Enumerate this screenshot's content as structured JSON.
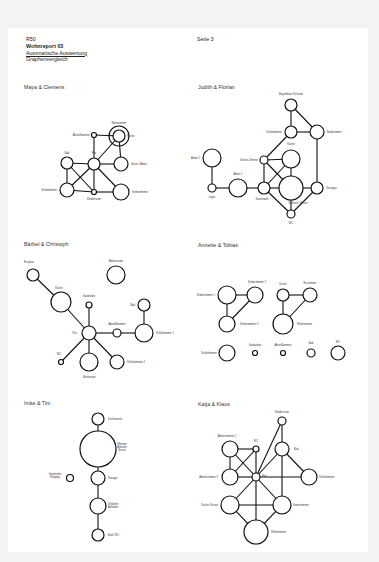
{
  "header": {
    "code": "R50",
    "title": "Wohnreport 03",
    "subtitle": "Automatische Auswertung",
    "section": "Graphenvergleich",
    "page": "Seite 3"
  },
  "colors": {
    "page": "#ffffff",
    "background": "#f3f3f3",
    "stroke": "#111111",
    "text": "#333333"
  },
  "graphs": [
    {
      "title": "Maya & Clemens",
      "tx": 24,
      "ty": 115,
      "nodes": [
        {
          "id": "wz",
          "label": "Wohnzimmer",
          "x": 119,
          "y": 136,
          "r": 10,
          "lx": 119,
          "ly": 124,
          "anchor": "middle"
        },
        {
          "id": "ku",
          "label": "Küche",
          "x": 119,
          "y": 136,
          "r": 6,
          "lx": 127,
          "ly": 137,
          "anchor": "start"
        },
        {
          "id": "ab",
          "label": "Abstellkammer",
          "x": 94,
          "y": 135,
          "r": 2.5,
          "lx": 90,
          "ly": 136,
          "anchor": "end"
        },
        {
          "id": "fl",
          "label": "Flur",
          "x": 94,
          "y": 164,
          "r": 6,
          "lx": 94,
          "ly": 154,
          "anchor": "middle"
        },
        {
          "id": "bad",
          "label": "Bad",
          "x": 67,
          "y": 163,
          "r": 6,
          "lx": 67,
          "ly": 154,
          "anchor": "middle"
        },
        {
          "id": "ga",
          "label": "Gäste / Arbeit",
          "x": 121,
          "y": 164,
          "r": 7,
          "lx": 131,
          "ly": 165,
          "anchor": "start"
        },
        {
          "id": "sz",
          "label": "Schlafzimmer",
          "x": 67,
          "y": 190,
          "r": 7,
          "lx": 57,
          "ly": 191,
          "anchor": "end"
        },
        {
          "id": "kl",
          "label": "Kleiderraum",
          "x": 94,
          "y": 192,
          "r": 2.5,
          "lx": 94,
          "ly": 200,
          "anchor": "middle"
        },
        {
          "id": "kz",
          "label": "Kinderzimmer",
          "x": 121,
          "y": 192,
          "r": 8,
          "lx": 132,
          "ly": 193,
          "anchor": "start"
        }
      ],
      "edges": [
        [
          "ab",
          "ku"
        ],
        [
          "ab",
          "fl"
        ],
        [
          "fl",
          "ku"
        ],
        [
          "fl",
          "bad"
        ],
        [
          "fl",
          "ga"
        ],
        [
          "ga",
          "ku"
        ],
        [
          "bad",
          "sz"
        ],
        [
          "bad",
          "kl"
        ],
        [
          "fl",
          "sz"
        ],
        [
          "fl",
          "kl"
        ],
        [
          "fl",
          "kz"
        ],
        [
          "sz",
          "kl"
        ],
        [
          "kl",
          "kz"
        ]
      ]
    },
    {
      "title": "Judith & Florian",
      "tx": 198,
      "ty": 118,
      "nodes": [
        {
          "id": "bs",
          "label": "Begehbarer Schrank",
          "x": 291,
          "y": 105,
          "r": 6,
          "lx": 291,
          "ly": 95,
          "anchor": "middle"
        },
        {
          "id": "sz",
          "label": "Schlafzimmer",
          "x": 291,
          "y": 132,
          "r": 6,
          "lx": 282,
          "ly": 133,
          "anchor": "end"
        },
        {
          "id": "bz",
          "label": "Badezimmer",
          "x": 317,
          "y": 132,
          "r": 7,
          "lx": 327,
          "ly": 133,
          "anchor": "start"
        },
        {
          "id": "ku",
          "label": "Küche",
          "x": 291,
          "y": 159,
          "r": 9,
          "lx": 291,
          "ly": 145,
          "anchor": "middle"
        },
        {
          "id": "gz",
          "label": "Grünes Zimmer",
          "x": 264,
          "y": 160,
          "r": 4,
          "lx": 258,
          "ly": 161,
          "anchor": "end"
        },
        {
          "id": "a2",
          "label": "Arbeit 2",
          "x": 212,
          "y": 158,
          "r": 9,
          "lx": 200,
          "ly": 159,
          "anchor": "end"
        },
        {
          "id": "a1",
          "label": "Arbeit 1",
          "x": 238,
          "y": 188,
          "r": 9,
          "lx": 238,
          "ly": 175,
          "anchor": "middle"
        },
        {
          "id": "lg",
          "label": "Lager",
          "x": 212,
          "y": 188,
          "r": 4,
          "lx": 212,
          "ly": 198,
          "anchor": "middle"
        },
        {
          "id": "kw",
          "label": "Katzenwelt",
          "x": 264,
          "y": 188,
          "r": 6,
          "lx": 262,
          "ly": 200,
          "anchor": "middle"
        },
        {
          "id": "we",
          "label": "Wohnen / Essen",
          "x": 291,
          "y": 188,
          "r": 12,
          "lx": 298,
          "ly": 204,
          "anchor": "middle"
        },
        {
          "id": "tn",
          "label": "Teenager",
          "x": 317,
          "y": 188,
          "r": 6,
          "lx": 326,
          "ly": 189,
          "anchor": "start"
        },
        {
          "id": "wc",
          "label": "WC",
          "x": 291,
          "y": 214,
          "r": 4,
          "lx": 291,
          "ly": 224,
          "anchor": "middle"
        }
      ],
      "edges": [
        [
          "bs",
          "sz"
        ],
        [
          "bs",
          "bz"
        ],
        [
          "sz",
          "bz"
        ],
        [
          "sz",
          "gz"
        ],
        [
          "bz",
          "tn"
        ],
        [
          "gz",
          "ku"
        ],
        [
          "gz",
          "kw"
        ],
        [
          "gz",
          "we"
        ],
        [
          "ku",
          "kw"
        ],
        [
          "ku",
          "we"
        ],
        [
          "a2",
          "lg"
        ],
        [
          "lg",
          "a1"
        ],
        [
          "a1",
          "kw"
        ],
        [
          "kw",
          "we"
        ],
        [
          "kw",
          "wc"
        ],
        [
          "we",
          "wc"
        ],
        [
          "we",
          "tn"
        ],
        [
          "tn",
          "wc"
        ]
      ]
    },
    {
      "title": "Bärbel & Christoph",
      "tx": 24,
      "ty": 246,
      "nodes": [
        {
          "id": "es",
          "label": "Essplatz",
          "x": 33,
          "y": 275,
          "r": 6,
          "lx": 29,
          "ly": 263,
          "anchor": "middle"
        },
        {
          "id": "ar",
          "label": "Arbeitsraum",
          "x": 116,
          "y": 275,
          "r": 9,
          "lx": 116,
          "ly": 262,
          "anchor": "middle"
        },
        {
          "id": "ku",
          "label": "Küche",
          "x": 61,
          "y": 302,
          "r": 10,
          "lx": 59,
          "ly": 289,
          "anchor": "middle"
        },
        {
          "id": "ga",
          "label": "Garderobe",
          "x": 89,
          "y": 305,
          "r": 3,
          "lx": 89,
          "ly": 297,
          "anchor": "middle"
        },
        {
          "id": "bad",
          "label": "Bad",
          "x": 144,
          "y": 305,
          "r": 6,
          "lx": 135,
          "ly": 306,
          "anchor": "end"
        },
        {
          "id": "fl",
          "label": "Flur",
          "x": 89,
          "y": 333,
          "r": 7,
          "lx": 77,
          "ly": 334,
          "anchor": "end"
        },
        {
          "id": "ak",
          "label": "Abstellkammer",
          "x": 117,
          "y": 333,
          "r": 4,
          "lx": 117,
          "ly": 325,
          "anchor": "middle"
        },
        {
          "id": "s1",
          "label": "Schlafzimmer 1",
          "x": 144,
          "y": 333,
          "r": 9,
          "lx": 156,
          "ly": 334,
          "anchor": "start"
        },
        {
          "id": "wc",
          "label": "WC",
          "x": 61,
          "y": 362,
          "r": 2.5,
          "lx": 59,
          "ly": 355,
          "anchor": "middle"
        },
        {
          "id": "wr",
          "label": "Wohnraum",
          "x": 89,
          "y": 362,
          "r": 9,
          "lx": 89,
          "ly": 378,
          "anchor": "middle"
        },
        {
          "id": "s2",
          "label": "Schlafzimmer 2",
          "x": 117,
          "y": 362,
          "r": 7,
          "lx": 127,
          "ly": 363,
          "anchor": "start"
        }
      ],
      "edges": [
        [
          "es",
          "ku"
        ],
        [
          "ku",
          "fl"
        ],
        [
          "ga",
          "fl"
        ],
        [
          "fl",
          "ak"
        ],
        [
          "ak",
          "s1"
        ],
        [
          "s1",
          "bad"
        ],
        [
          "fl",
          "wc"
        ],
        [
          "fl",
          "wr"
        ],
        [
          "fl",
          "s2"
        ]
      ]
    },
    {
      "title": "Annette & Tobias",
      "tx": 198,
      "ty": 247,
      "nodes": [
        {
          "id": "k1",
          "label": "Kinderzimmer 1",
          "x": 227,
          "y": 295,
          "r": 9,
          "lx": 215,
          "ly": 296,
          "anchor": "end"
        },
        {
          "id": "k2",
          "label": "Kinderzimmer 2",
          "x": 255,
          "y": 295,
          "r": 8,
          "lx": 257,
          "ly": 283,
          "anchor": "middle"
        },
        {
          "id": "k3",
          "label": "Kinderzimmer 3",
          "x": 227,
          "y": 324,
          "r": 8,
          "lx": 240,
          "ly": 325,
          "anchor": "start"
        },
        {
          "id": "ku",
          "label": "Küche",
          "x": 283,
          "y": 295,
          "r": 6,
          "lx": 283,
          "ly": 285,
          "anchor": "middle"
        },
        {
          "id": "ez",
          "label": "Esszimmer",
          "x": 310,
          "y": 295,
          "r": 7,
          "lx": 310,
          "ly": 284,
          "anchor": "middle"
        },
        {
          "id": "wz",
          "label": "Wohnzimmer",
          "x": 283,
          "y": 324,
          "r": 10,
          "lx": 297,
          "ly": 325,
          "anchor": "start"
        },
        {
          "id": "sz",
          "label": "Schlafzimmer",
          "x": 227,
          "y": 353,
          "r": 8,
          "lx": 217,
          "ly": 354,
          "anchor": "end"
        },
        {
          "id": "gd",
          "label": "Garderobe",
          "x": 255,
          "y": 353,
          "r": 2.5,
          "lx": 255,
          "ly": 346,
          "anchor": "middle"
        },
        {
          "id": "ak",
          "label": "Abstellkammer",
          "x": 283,
          "y": 353,
          "r": 2.5,
          "lx": 283,
          "ly": 346,
          "anchor": "middle"
        },
        {
          "id": "bad",
          "label": "Bad",
          "x": 311,
          "y": 353,
          "r": 4,
          "lx": 311,
          "ly": 344,
          "anchor": "middle"
        },
        {
          "id": "wc",
          "label": "WC",
          "x": 338,
          "y": 353,
          "r": 7,
          "lx": 338,
          "ly": 343,
          "anchor": "middle"
        }
      ],
      "edges": [
        [
          "k1",
          "k2"
        ],
        [
          "k1",
          "k3"
        ],
        [
          "k2",
          "k3"
        ],
        [
          "ku",
          "ez"
        ],
        [
          "ku",
          "wz"
        ],
        [
          "ez",
          "wz"
        ]
      ]
    },
    {
      "title": "Imke & Tim",
      "tx": 24,
      "ty": 404,
      "nodes": [
        {
          "id": "kz",
          "label": "Küchenzeile",
          "x": 98,
          "y": 419,
          "r": 6,
          "lx": 108,
          "ly": 420,
          "anchor": "start"
        },
        {
          "id": "wae",
          "label": "Wohnen|Arbeiten|Essen",
          "x": 98,
          "y": 449,
          "r": 18,
          "lx": 122,
          "ly": 445,
          "anchor": "middle"
        },
        {
          "id": "st",
          "label": "Storage",
          "x": 98,
          "y": 478,
          "r": 7,
          "lx": 108,
          "ly": 479,
          "anchor": "start"
        },
        {
          "id": "ge",
          "label": "Garderobe|Eingang",
          "x": 70,
          "y": 478,
          "r": 3.5,
          "lx": 55,
          "ly": 475,
          "anchor": "middle"
        },
        {
          "id": "sa",
          "label": "Schlafen|Ankleide",
          "x": 98,
          "y": 506,
          "r": 8,
          "lx": 108,
          "ly": 505,
          "anchor": "start"
        },
        {
          "id": "bw",
          "label": "Bad / WC",
          "x": 98,
          "y": 535,
          "r": 6,
          "lx": 108,
          "ly": 536,
          "anchor": "start"
        }
      ],
      "edges": [
        [
          "kz",
          "wae"
        ],
        [
          "wae",
          "st"
        ],
        [
          "st",
          "sa"
        ],
        [
          "sa",
          "bw"
        ]
      ]
    },
    {
      "title": "Katja & Klaus",
      "tx": 198,
      "ty": 406,
      "nodes": [
        {
          "id": "kr",
          "label": "Kleiderraum",
          "x": 282,
          "y": 421,
          "r": 4,
          "lx": 282,
          "ly": 413,
          "anchor": "middle"
        },
        {
          "id": "a1",
          "label": "Arbeitszimmer 1",
          "x": 230,
          "y": 449,
          "r": 8,
          "lx": 227,
          "ly": 437,
          "anchor": "middle"
        },
        {
          "id": "wc",
          "label": "WC",
          "x": 256,
          "y": 449,
          "r": 3,
          "lx": 256,
          "ly": 442,
          "anchor": "middle"
        },
        {
          "id": "bad",
          "label": "Bad",
          "x": 282,
          "y": 449,
          "r": 7,
          "lx": 294,
          "ly": 450,
          "anchor": "start"
        },
        {
          "id": "a2",
          "label": "Arbeitszimmer 2",
          "x": 230,
          "y": 477,
          "r": 8,
          "lx": 218,
          "ly": 478,
          "anchor": "end"
        },
        {
          "id": "fl",
          "label": "Flur",
          "x": 256,
          "y": 477,
          "r": 4,
          "lx": 262,
          "ly": 477,
          "anchor": "start"
        },
        {
          "id": "sz",
          "label": "Schlafzimmer",
          "x": 309,
          "y": 477,
          "r": 8,
          "lx": 319,
          "ly": 478,
          "anchor": "start"
        },
        {
          "id": "ke",
          "label": "Küche / Essen",
          "x": 230,
          "y": 505,
          "r": 9,
          "lx": 218,
          "ly": 506,
          "anchor": "end"
        },
        {
          "id": "kz",
          "label": "Kinderzimmer",
          "x": 282,
          "y": 505,
          "r": 9,
          "lx": 293,
          "ly": 506,
          "anchor": "start"
        },
        {
          "id": "wz",
          "label": "Wohnzimmer",
          "x": 256,
          "y": 532,
          "r": 12,
          "lx": 271,
          "ly": 533,
          "anchor": "start"
        }
      ],
      "edges": [
        [
          "kr",
          "fl"
        ],
        [
          "kr",
          "bad"
        ],
        [
          "a1",
          "wc"
        ],
        [
          "a1",
          "a2"
        ],
        [
          "a1",
          "fl"
        ],
        [
          "wc",
          "a2"
        ],
        [
          "wc",
          "fl"
        ],
        [
          "bad",
          "fl"
        ],
        [
          "bad",
          "sz"
        ],
        [
          "bad",
          "kz"
        ],
        [
          "a2",
          "fl"
        ],
        [
          "fl",
          "sz"
        ],
        [
          "fl",
          "ke"
        ],
        [
          "fl",
          "kz"
        ],
        [
          "fl",
          "wz"
        ],
        [
          "ke",
          "kz"
        ],
        [
          "ke",
          "wz"
        ],
        [
          "kz",
          "wz"
        ]
      ]
    }
  ]
}
